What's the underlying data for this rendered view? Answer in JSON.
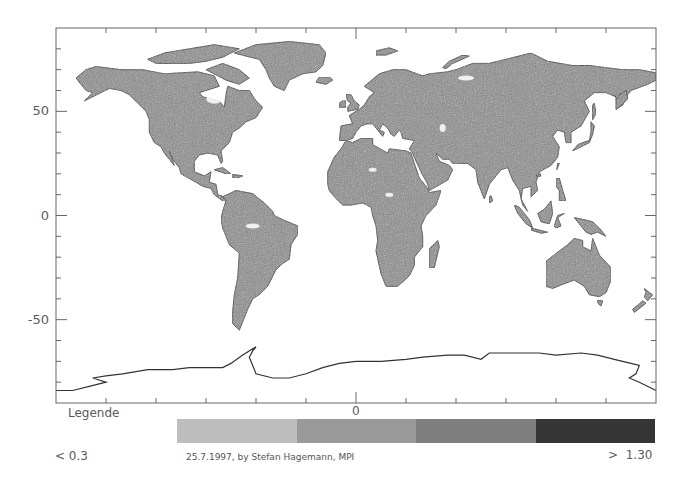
{
  "map": {
    "projection": "equirectangular",
    "frame": {
      "left": 56,
      "top": 28,
      "right": 656,
      "bottom": 403
    },
    "lon_range": [
      -180,
      180
    ],
    "lat_range": [
      -90,
      90
    ],
    "y_axis": {
      "labels": [
        {
          "value": 50,
          "text": "50"
        },
        {
          "value": 0,
          "text": "0"
        },
        {
          "value": -50,
          "text": "-50"
        }
      ],
      "tick_step_deg": 10
    },
    "x_axis": {
      "tick_step_deg": 30,
      "major_label": "0"
    },
    "land_color": "#8a8a8a",
    "outline_color": "#333333"
  },
  "legend": {
    "title": "Legende",
    "center_label": "0",
    "min_label": "< 0.3",
    "max_label": ">  1.30",
    "credit": "25.7.1997, by Stefan Hagemann, MPI",
    "classes": [
      {
        "color": "#bdbdbd"
      },
      {
        "color": "#9a9a9a"
      },
      {
        "color": "#7e7e7e"
      },
      {
        "color": "#353535"
      }
    ]
  }
}
